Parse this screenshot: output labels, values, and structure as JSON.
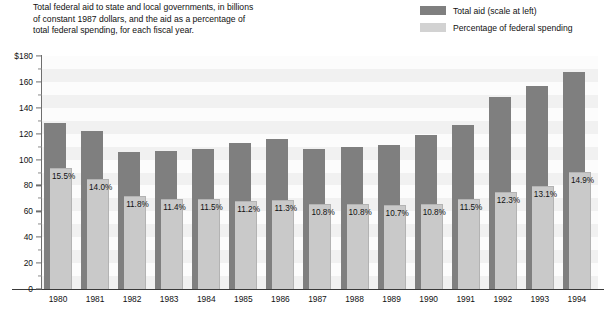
{
  "caption": {
    "lines": [
      "Total federal aid to state and local governments, in billions",
      "of constant 1987 dollars, and the aid as a percentage of",
      "total federal spending, for each fiscal year."
    ]
  },
  "legend": {
    "items": [
      {
        "label": "Total aid (scale at left)",
        "color": "#7f7f7f"
      },
      {
        "label": "Percentage of federal spending",
        "color": "#d2d2d2"
      }
    ]
  },
  "colors": {
    "total_aid": "#7f7f7f",
    "percentage": "#c9c9c9",
    "axis": "#6e6e6e",
    "band": "#f1f1f1",
    "plot_background": "#fcfcfc"
  },
  "axis": {
    "y_major_labels": [
      "$180",
      "160",
      "140",
      "120",
      "100",
      "80",
      "60",
      "40",
      "20",
      "0"
    ],
    "y_major_values": [
      180,
      160,
      140,
      120,
      100,
      80,
      60,
      40,
      20,
      0
    ],
    "y_minor_values": [
      170,
      150,
      130,
      110,
      90,
      70,
      50,
      30,
      10
    ],
    "y_min": 0,
    "y_max": 180,
    "pct_scale_max": 30.0
  },
  "chart_data": {
    "type": "bar",
    "title": "Total federal aid to state and local governments, in billions of constant 1987 dollars, and the aid as a percentage of total federal spending, for each fiscal year.",
    "xlabel": "",
    "ylabel": "$ billions (constant 1987 dollars)",
    "ylim": [
      0,
      180
    ],
    "grid": true,
    "legend_position": "top-right",
    "categories": [
      "1980",
      "1981",
      "1982",
      "1983",
      "1984",
      "1985",
      "1986",
      "1987",
      "1988",
      "1989",
      "1990",
      "1991",
      "1992",
      "1993",
      "1994"
    ],
    "series": [
      {
        "name": "Total aid (scale at left)",
        "unit": "billions of constant 1987 dollars",
        "values": [
          128,
          122,
          106,
          107,
          108,
          113,
          116,
          108,
          110,
          111,
          119,
          127,
          148,
          157,
          168
        ]
      },
      {
        "name": "Percentage of federal spending",
        "unit": "percent",
        "values": [
          15.5,
          14.0,
          11.8,
          11.4,
          11.5,
          11.2,
          11.3,
          10.8,
          10.8,
          10.7,
          10.8,
          11.5,
          12.3,
          13.1,
          14.9
        ],
        "labels": [
          "15.5%",
          "14.0%",
          "11.8%",
          "11.4%",
          "11.5%",
          "11.2%",
          "11.3%",
          "10.8%",
          "10.8%",
          "10.7%",
          "10.8%",
          "11.5%",
          "12.3%",
          "13.1%",
          "14.9%"
        ]
      }
    ]
  }
}
